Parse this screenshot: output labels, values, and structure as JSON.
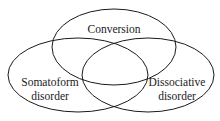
{
  "diagram": {
    "type": "venn",
    "sets": [
      {
        "id": "conversion",
        "label_lines": [
          "Conversion"
        ],
        "cx": 114,
        "cy": 47,
        "rx": 62,
        "ry": 38
      },
      {
        "id": "somatoform",
        "label_lines": [
          "Somatoform",
          "disorder"
        ],
        "cx": 78,
        "cy": 75,
        "rx": 70,
        "ry": 37
      },
      {
        "id": "dissociative",
        "label_lines": [
          "Dissociative",
          "disorder"
        ],
        "cx": 148,
        "cy": 75,
        "rx": 66,
        "ry": 37
      }
    ],
    "stroke_color": "#1a1a1a",
    "background": "#ffffff"
  }
}
